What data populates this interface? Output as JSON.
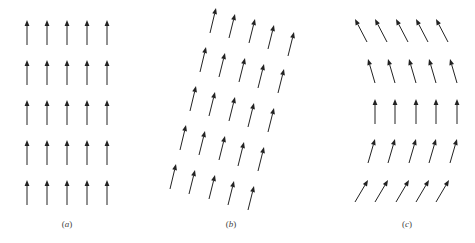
{
  "figure": {
    "arrow_color": "#222222",
    "panels": [
      {
        "id": "a",
        "label": "a",
        "label_pos": [
          67,
          219
        ],
        "description": "uniform lattice, all arrows vertical",
        "arrows": [
          [
            [
              27,
              45
            ],
            [
              27,
              20
            ]
          ],
          [
            [
              47,
              45
            ],
            [
              47,
              20
            ]
          ],
          [
            [
              67,
              45
            ],
            [
              67,
              20
            ]
          ],
          [
            [
              87,
              45
            ],
            [
              87,
              20
            ]
          ],
          [
            [
              107,
              45
            ],
            [
              107,
              20
            ]
          ],
          [
            [
              27,
              85
            ],
            [
              27,
              60
            ]
          ],
          [
            [
              47,
              85
            ],
            [
              47,
              60
            ]
          ],
          [
            [
              67,
              85
            ],
            [
              67,
              60
            ]
          ],
          [
            [
              87,
              85
            ],
            [
              87,
              60
            ]
          ],
          [
            [
              107,
              85
            ],
            [
              107,
              60
            ]
          ],
          [
            [
              27,
              125
            ],
            [
              27,
              100
            ]
          ],
          [
            [
              47,
              125
            ],
            [
              47,
              100
            ]
          ],
          [
            [
              67,
              125
            ],
            [
              67,
              100
            ]
          ],
          [
            [
              87,
              125
            ],
            [
              87,
              100
            ]
          ],
          [
            [
              107,
              125
            ],
            [
              107,
              100
            ]
          ],
          [
            [
              27,
              165
            ],
            [
              27,
              140
            ]
          ],
          [
            [
              47,
              165
            ],
            [
              47,
              140
            ]
          ],
          [
            [
              67,
              165
            ],
            [
              67,
              140
            ]
          ],
          [
            [
              87,
              165
            ],
            [
              87,
              140
            ]
          ],
          [
            [
              107,
              165
            ],
            [
              107,
              140
            ]
          ],
          [
            [
              27,
              205
            ],
            [
              27,
              180
            ]
          ],
          [
            [
              47,
              205
            ],
            [
              47,
              180
            ]
          ],
          [
            [
              67,
              205
            ],
            [
              67,
              180
            ]
          ],
          [
            [
              87,
              205
            ],
            [
              87,
              180
            ]
          ],
          [
            [
              107,
              205
            ],
            [
              107,
              180
            ]
          ]
        ]
      },
      {
        "id": "b",
        "label": "b",
        "label_pos": [
          231,
          219
        ],
        "description": "sheared lattice, all arrows tilted right",
        "arrows": [
          [
            [
              210,
              33
            ],
            [
              216,
              8
            ]
          ],
          [
            [
              229,
              38
            ],
            [
              235,
              14
            ]
          ],
          [
            [
              249,
              43
            ],
            [
              255,
              19
            ]
          ],
          [
            [
              268,
              49
            ],
            [
              274,
              25
            ]
          ],
          [
            [
              288,
              56
            ],
            [
              294,
              32
            ]
          ],
          [
            [
              200,
              72
            ],
            [
              206,
              47
            ]
          ],
          [
            [
              219,
              77
            ],
            [
              225,
              53
            ]
          ],
          [
            [
              239,
              82
            ],
            [
              245,
              58
            ]
          ],
          [
            [
              258,
              88
            ],
            [
              264,
              64
            ]
          ],
          [
            [
              278,
              93
            ],
            [
              284,
              69
            ]
          ],
          [
            [
              190,
              111
            ],
            [
              196,
              86
            ]
          ],
          [
            [
              209,
              116
            ],
            [
              215,
              92
            ]
          ],
          [
            [
              229,
              121
            ],
            [
              235,
              97
            ]
          ],
          [
            [
              248,
              127
            ],
            [
              254,
              103
            ]
          ],
          [
            [
              268,
              132
            ],
            [
              274,
              108
            ]
          ],
          [
            [
              180,
              150
            ],
            [
              186,
              125
            ]
          ],
          [
            [
              199,
              155
            ],
            [
              205,
              131
            ]
          ],
          [
            [
              219,
              160
            ],
            [
              225,
              136
            ]
          ],
          [
            [
              238,
              166
            ],
            [
              244,
              142
            ]
          ],
          [
            [
              258,
              171
            ],
            [
              264,
              147
            ]
          ],
          [
            [
              170,
              189
            ],
            [
              176,
              164
            ]
          ],
          [
            [
              189,
              194
            ],
            [
              195,
              170
            ]
          ],
          [
            [
              209,
              199
            ],
            [
              215,
              175
            ]
          ],
          [
            [
              228,
              205
            ],
            [
              234,
              181
            ]
          ],
          [
            [
              248,
              210
            ],
            [
              254,
              186
            ]
          ]
        ]
      },
      {
        "id": "c",
        "label": "c",
        "label_pos": [
          407,
          219
        ],
        "description": "lattice with arrows rotating from tilted left (top) to vertical (middle) to tilted right (bottom)",
        "arrows": [
          [
            [
              367,
              42
            ],
            [
              355,
              19
            ]
          ],
          [
            [
              387,
              42
            ],
            [
              375,
              19
            ]
          ],
          [
            [
              408,
              42
            ],
            [
              396,
              19
            ]
          ],
          [
            [
              428,
              42
            ],
            [
              416,
              19
            ]
          ],
          [
            [
              448,
              42
            ],
            [
              436,
              19
            ]
          ],
          [
            [
              375,
              83
            ],
            [
              368,
              59
            ]
          ],
          [
            [
              395,
              83
            ],
            [
              388,
              59
            ]
          ],
          [
            [
              416,
              83
            ],
            [
              409,
              59
            ]
          ],
          [
            [
              436,
              83
            ],
            [
              429,
              59
            ]
          ],
          [
            [
              457,
              83
            ],
            [
              450,
              59
            ]
          ],
          [
            [
              375,
              124
            ],
            [
              375,
              99
            ]
          ],
          [
            [
              395,
              124
            ],
            [
              395,
              99
            ]
          ],
          [
            [
              416,
              124
            ],
            [
              416,
              99
            ]
          ],
          [
            [
              436,
              124
            ],
            [
              436,
              99
            ]
          ],
          [
            [
              457,
              124
            ],
            [
              457,
              99
            ]
          ],
          [
            [
              368,
              163
            ],
            [
              375,
              139
            ]
          ],
          [
            [
              388,
              163
            ],
            [
              395,
              139
            ]
          ],
          [
            [
              409,
              163
            ],
            [
              416,
              139
            ]
          ],
          [
            [
              429,
              163
            ],
            [
              436,
              139
            ]
          ],
          [
            [
              450,
              163
            ],
            [
              457,
              139
            ]
          ],
          [
            [
              355,
              202
            ],
            [
              368,
              180
            ]
          ],
          [
            [
              375,
              202
            ],
            [
              388,
              180
            ]
          ],
          [
            [
              396,
              202
            ],
            [
              409,
              180
            ]
          ],
          [
            [
              416,
              202
            ],
            [
              429,
              180
            ]
          ],
          [
            [
              436,
              202
            ],
            [
              449,
              180
            ]
          ]
        ]
      }
    ]
  }
}
